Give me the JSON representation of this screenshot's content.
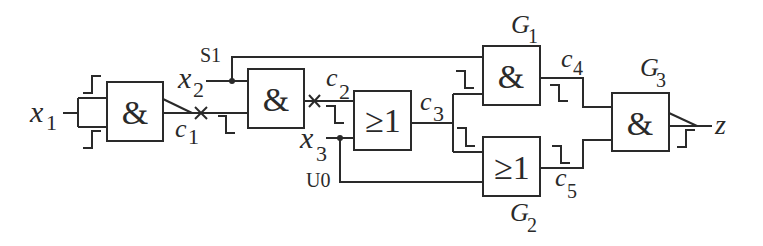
{
  "diagram": {
    "type": "logic-circuit",
    "colors": {
      "line": "#2a2a2a",
      "background": "#ffffff"
    },
    "inputs": [
      {
        "id": "x1",
        "label": "x",
        "sub": "1"
      },
      {
        "id": "x2",
        "label": "x",
        "sub": "2"
      },
      {
        "id": "x3",
        "label": "x",
        "sub": "3"
      }
    ],
    "output": {
      "id": "z",
      "label": "z"
    },
    "fault_labels": {
      "s1": "S1",
      "u0": "U0"
    },
    "gates": [
      {
        "id": "A1",
        "symbol": "&",
        "name": ""
      },
      {
        "id": "A2",
        "symbol": "&",
        "name": ""
      },
      {
        "id": "O1",
        "symbol": "≥1",
        "name": ""
      },
      {
        "id": "G1",
        "symbol": "&",
        "name": "G",
        "sub": "1"
      },
      {
        "id": "G2",
        "symbol": "≥1",
        "name": "G",
        "sub": "2"
      },
      {
        "id": "G3",
        "symbol": "&",
        "name": "G",
        "sub": "3"
      }
    ],
    "signals": [
      {
        "id": "c1",
        "label": "c",
        "sub": "1"
      },
      {
        "id": "c2",
        "label": "c",
        "sub": "2"
      },
      {
        "id": "c3",
        "label": "c",
        "sub": "3"
      },
      {
        "id": "c4",
        "label": "c",
        "sub": "4"
      },
      {
        "id": "c5",
        "label": "c",
        "sub": "5"
      }
    ],
    "markers": {
      "cut": "×"
    },
    "waveforms": {
      "x1_upper": "rising",
      "x1_lower": "rising",
      "c1": "falling",
      "c2": "falling",
      "g1_in": "falling",
      "g2_in": "falling",
      "c4": "falling",
      "c5": "falling",
      "z": "rising"
    }
  }
}
